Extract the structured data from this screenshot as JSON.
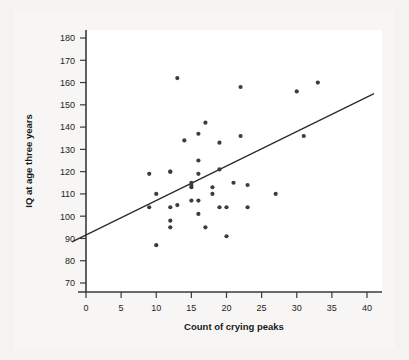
{
  "figure": {
    "title": "",
    "background_color": "#f4f3f2",
    "plot_background_color": "#ffffff",
    "point_color": "#3c3c44",
    "line_color": "#2b2b2b"
  },
  "chart_data": {
    "type": "scatter",
    "title": "",
    "subtitle": "",
    "xlabel": "Count of crying peaks",
    "ylabel": "IQ at age three years",
    "xlim": [
      -2,
      42
    ],
    "ylim": [
      66,
      184
    ],
    "xticks": [
      0,
      5,
      10,
      15,
      20,
      25,
      30,
      35,
      40
    ],
    "yticks": [
      70,
      80,
      90,
      100,
      110,
      120,
      130,
      140,
      150,
      160,
      170,
      180
    ],
    "xtick_labels": [
      "0",
      "5",
      "10",
      "15",
      "20",
      "25",
      "30",
      "35",
      "40"
    ],
    "ytick_labels": [
      "70",
      "80",
      "90",
      "100",
      "110",
      "120",
      "130",
      "140",
      "150",
      "160",
      "170",
      "180"
    ],
    "grid": false,
    "legend": false,
    "legend_position": "none",
    "x": [
      9,
      10,
      9,
      10,
      12,
      12,
      12,
      12,
      12,
      13,
      13,
      13,
      15,
      15,
      15,
      15,
      15,
      16,
      16,
      16,
      16,
      16,
      16,
      17,
      17,
      17,
      18,
      18,
      18,
      19,
      19,
      19,
      20,
      20,
      21,
      22,
      22,
      23,
      23,
      27,
      30,
      31,
      33
    ],
    "y": [
      119,
      110,
      104,
      87,
      120,
      120,
      104,
      98,
      95,
      105,
      162,
      134,
      115,
      114,
      107,
      114,
      113,
      137,
      125,
      119,
      142,
      107,
      101,
      95,
      107,
      113,
      110,
      113,
      121,
      133,
      104,
      91,
      104,
      115,
      158,
      136,
      115,
      114,
      104,
      110,
      156,
      136,
      160
    ],
    "series": [
      {
        "name": "infants",
        "points": [
          [
            9,
            119
          ],
          [
            9,
            104
          ],
          [
            10,
            110
          ],
          [
            10,
            87
          ],
          [
            12,
            120
          ],
          [
            12,
            120
          ],
          [
            12,
            104
          ],
          [
            12,
            98
          ],
          [
            12,
            95
          ],
          [
            13,
            105
          ],
          [
            13,
            162
          ],
          [
            14,
            134
          ],
          [
            15,
            115
          ],
          [
            15,
            114
          ],
          [
            15,
            113
          ],
          [
            15,
            107
          ],
          [
            16,
            137
          ],
          [
            16,
            125
          ],
          [
            16,
            119
          ],
          [
            16,
            107
          ],
          [
            16,
            101
          ],
          [
            17,
            142
          ],
          [
            17,
            95
          ],
          [
            18,
            113
          ],
          [
            18,
            110
          ],
          [
            19,
            121
          ],
          [
            19,
            133
          ],
          [
            19,
            104
          ],
          [
            20,
            104
          ],
          [
            20,
            91
          ],
          [
            21,
            115
          ],
          [
            22,
            158
          ],
          [
            22,
            136
          ],
          [
            23,
            114
          ],
          [
            23,
            104
          ],
          [
            27,
            110
          ],
          [
            30,
            156
          ],
          [
            31,
            136
          ],
          [
            33,
            160
          ]
        ]
      }
    ],
    "fit_line": {
      "name": "least-squares regression line",
      "x_start": -2,
      "y_start": 88.5,
      "x_end": 41,
      "y_end": 155
    }
  },
  "axes": {
    "x_axis_name": "x-axis",
    "y_axis_name": "y-axis"
  }
}
